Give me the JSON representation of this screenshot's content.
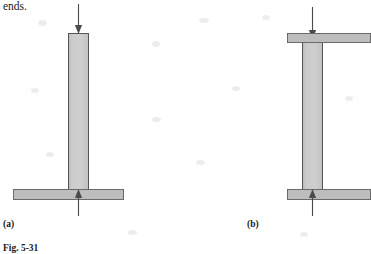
{
  "page": {
    "width": 365,
    "height": 254,
    "background_color": "#ffffff",
    "running_text": "ends.",
    "caption": "Fig. 5-31"
  },
  "colors": {
    "member_fill": "#c9c9c9",
    "member_stroke": "#555555",
    "plate_fill": "#bdbdbd",
    "plate_stroke": "#6a6a6a",
    "arrow_color": "#4a4a4a",
    "text_color": "#1a1a1a"
  },
  "figures": [
    {
      "id": "a",
      "label": "(a)",
      "description": "Column fixed at base plate, free at top, with axial compressive load applied at the free upper end and reaction at the base",
      "column": {
        "x": 68,
        "y": 33,
        "width": 21,
        "height": 157
      },
      "plates": [
        {
          "name": "base-plate",
          "x": 13,
          "y": 189,
          "width": 111,
          "height": 11
        }
      ],
      "arrows": [
        {
          "name": "top-load-arrow",
          "direction": "down",
          "x": 78,
          "y_start": 4,
          "y_end": 33
        },
        {
          "name": "base-reaction-arrow",
          "direction": "up",
          "x": 78,
          "y_start": 216,
          "y_end": 190
        }
      ]
    },
    {
      "id": "b",
      "label": "(b)",
      "description": "Column with plates at both ends, axial compressive load applied through the top plate and reaction through the bottom plate",
      "column": {
        "x": 302,
        "y": 39,
        "width": 21,
        "height": 151
      },
      "plates": [
        {
          "name": "top-plate",
          "x": 287,
          "y": 33,
          "width": 78,
          "height": 10
        },
        {
          "name": "bottom-plate",
          "x": 287,
          "y": 189,
          "width": 78,
          "height": 11
        }
      ],
      "arrows": [
        {
          "name": "top-load-arrow",
          "direction": "down",
          "x": 312,
          "y_start": 7,
          "y_end": 38
        },
        {
          "name": "bottom-reaction-arrow",
          "direction": "up",
          "x": 312,
          "y_start": 216,
          "y_end": 190
        }
      ]
    }
  ]
}
